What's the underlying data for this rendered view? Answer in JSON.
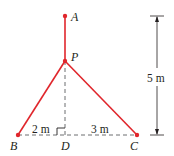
{
  "diagram": {
    "points": {
      "A": {
        "label": "A",
        "x": 65,
        "y": 16
      },
      "P": {
        "label": "P",
        "x": 65,
        "y": 61
      },
      "B": {
        "label": "B",
        "x": 18,
        "y": 135
      },
      "D": {
        "label": "D",
        "x": 65,
        "y": 135
      },
      "C": {
        "label": "C",
        "x": 137,
        "y": 135
      }
    },
    "dimensions": {
      "BD": "2 m",
      "DC": "3 m",
      "height": "5 m"
    },
    "colors": {
      "cable": "#e0262c",
      "line": "#231f20",
      "dashed": "#6d6e70"
    }
  }
}
